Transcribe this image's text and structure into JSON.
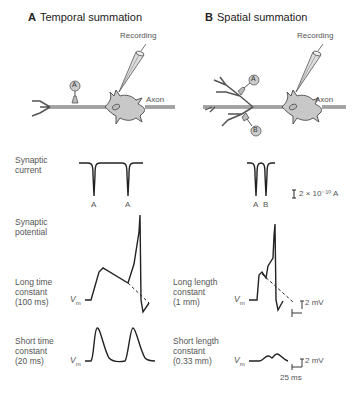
{
  "panels": {
    "A": {
      "letter": "A",
      "title": "Temporal summation",
      "recording_label": "Recording",
      "axon_label": "Axon",
      "synapse_labels": [
        "A"
      ],
      "current_event_labels": [
        "A",
        "A"
      ],
      "long_label": [
        "Long time",
        "constant",
        "(100 ms)"
      ],
      "short_label": [
        "Short time",
        "constant",
        "(20 ms)"
      ]
    },
    "B": {
      "letter": "B",
      "title": "Spatial summation",
      "recording_label": "Recording",
      "axon_label": "Axon",
      "synapse_labels": [
        "A",
        "B"
      ],
      "current_event_labels": [
        "A",
        "B"
      ],
      "long_label": [
        "Long length",
        "constant",
        "(1 mm)"
      ],
      "short_label": [
        "Short length",
        "constant",
        "(0.33 mm)"
      ]
    }
  },
  "row_labels": {
    "synaptic_current": [
      "Synaptic",
      "current"
    ],
    "synaptic_potential": [
      "Synaptic",
      "potential"
    ]
  },
  "vm_label": "V",
  "vm_sub": "m",
  "scale_bars": {
    "current": "2 × 10⁻¹⁰ A",
    "voltage_long": "2 mV",
    "voltage_short": "2 mV",
    "time": "25 ms"
  },
  "colors": {
    "trace": "#222222",
    "cell_fill": "#c8c8c8",
    "cell_stroke": "#555555",
    "text": "#555555"
  }
}
